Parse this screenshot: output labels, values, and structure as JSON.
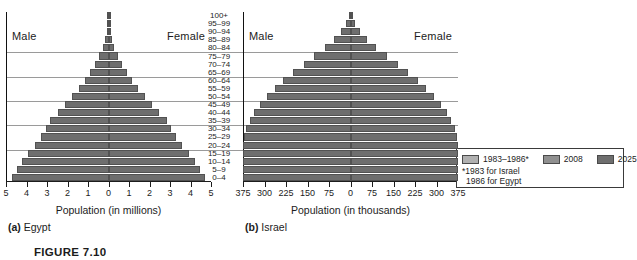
{
  "figure": {
    "caption": "FIGURE 7.10"
  },
  "age_groups": [
    "100+",
    "95–99",
    "90–94",
    "85–89",
    "80–84",
    "75–79",
    "70–74",
    "65–69",
    "60–64",
    "55–59",
    "50–54",
    "45–49",
    "40–44",
    "35–39",
    "30–34",
    "25–29",
    "20–24",
    "15–19",
    "10–14",
    "5–9",
    "0–4"
  ],
  "gridline_after_indices": [
    5,
    8,
    11,
    14,
    17
  ],
  "legend": {
    "entries": [
      {
        "label": "1983–1986*",
        "color": "#b0b0b0"
      },
      {
        "label": "2008",
        "color": "#909090"
      },
      {
        "label": "2025",
        "color": "#6e6e6e"
      }
    ],
    "note_line1": "*1983 for Israel",
    "note_line2": "1986 for Egypt"
  },
  "panels": {
    "egypt": {
      "caption_prefix": "(a)",
      "caption_name": "Egypt",
      "male_label": "Male",
      "female_label": "Female",
      "axis_title": "Population (in millions)",
      "tick_labels": [
        "5",
        "4",
        "3",
        "2",
        "1",
        "0",
        "1",
        "2",
        "3",
        "4",
        "5"
      ],
      "axis_max": 5
    },
    "israel": {
      "caption_prefix": "(b)",
      "caption_name": "Israel",
      "male_label": "Male",
      "female_label": "Female",
      "axis_title": "Population (in thousands)",
      "tick_labels": [
        "375",
        "300",
        "225",
        "150",
        "75",
        "0",
        "75",
        "150",
        "225",
        "300",
        "375"
      ],
      "axis_max": 375
    }
  },
  "chart_data": {
    "type": "bar",
    "subtype": "population-pyramid",
    "title": "FIGURE 7.10",
    "xlabel": "Population",
    "ylabel": "Age group",
    "grid": true,
    "legend_position": "right",
    "series_names": [
      "1983–1986*",
      "2008",
      "2025"
    ],
    "categories": [
      "100+",
      "95–99",
      "90–94",
      "85–89",
      "80–84",
      "75–79",
      "70–74",
      "65–69",
      "60–64",
      "55–59",
      "50–54",
      "45–49",
      "40–44",
      "35–39",
      "30–34",
      "25–29",
      "20–24",
      "15–19",
      "10–14",
      "5–9",
      "0–4"
    ],
    "charts": [
      {
        "name": "Egypt",
        "units": "millions",
        "xlim": [
          -5,
          5
        ],
        "xticks": [
          -5,
          -4,
          -3,
          -2,
          -1,
          0,
          1,
          2,
          3,
          4,
          5
        ],
        "xticklabels": [
          "5",
          "4",
          "3",
          "2",
          "1",
          "0",
          "1",
          "2",
          "3",
          "4",
          "5"
        ],
        "series": [
          {
            "name": "1983–1986*",
            "male": [
              0.0,
              0.01,
              0.02,
              0.05,
              0.1,
              0.17,
              0.26,
              0.38,
              0.52,
              0.68,
              0.86,
              1.06,
              1.28,
              1.52,
              1.78,
              2.06,
              2.36,
              2.68,
              3.02,
              3.38,
              3.76
            ],
            "female": [
              0.0,
              0.01,
              0.02,
              0.05,
              0.1,
              0.17,
              0.26,
              0.38,
              0.52,
              0.68,
              0.86,
              1.06,
              1.28,
              1.52,
              1.78,
              2.06,
              2.36,
              2.68,
              3.02,
              3.38,
              3.76
            ]
          },
          {
            "name": "2008",
            "male": [
              0.01,
              0.02,
              0.05,
              0.1,
              0.18,
              0.3,
              0.45,
              0.63,
              0.84,
              1.06,
              1.3,
              1.56,
              1.84,
              2.14,
              2.46,
              2.8,
              3.16,
              3.54,
              3.86,
              4.06,
              4.22
            ],
            "female": [
              0.01,
              0.02,
              0.05,
              0.1,
              0.18,
              0.3,
              0.45,
              0.63,
              0.84,
              1.06,
              1.3,
              1.56,
              1.84,
              2.14,
              2.46,
              2.8,
              3.16,
              3.54,
              3.86,
              4.06,
              4.22
            ]
          },
          {
            "name": "2025",
            "male": [
              0.02,
              0.04,
              0.09,
              0.17,
              0.29,
              0.45,
              0.65,
              0.89,
              1.16,
              1.46,
              1.78,
              2.12,
              2.48,
              2.86,
              3.04,
              3.3,
              3.6,
              3.92,
              4.22,
              4.46,
              4.7
            ],
            "female": [
              0.02,
              0.04,
              0.09,
              0.17,
              0.29,
              0.45,
              0.65,
              0.89,
              1.16,
              1.46,
              1.78,
              2.12,
              2.48,
              2.86,
              3.04,
              3.3,
              3.6,
              3.92,
              4.22,
              4.46,
              4.7
            ]
          }
        ]
      },
      {
        "name": "Israel",
        "units": "thousands",
        "xlim": [
          -375,
          375
        ],
        "xticks": [
          -375,
          -300,
          -225,
          -150,
          -75,
          0,
          75,
          150,
          225,
          300,
          375
        ],
        "xticklabels": [
          "375",
          "300",
          "225",
          "150",
          "75",
          "0",
          "75",
          "150",
          "225",
          "300",
          "375"
        ],
        "series": [
          {
            "name": "1983–1986*",
            "male": [
              1,
              4,
              10,
              20,
              35,
              55,
              78,
              102,
              128,
              154,
              180,
              206,
              230,
              252,
              272,
              290,
              304,
              314,
              320,
              322,
              320
            ],
            "female": [
              1,
              4,
              10,
              20,
              35,
              55,
              78,
              102,
              128,
              154,
              180,
              206,
              230,
              252,
              272,
              290,
              304,
              314,
              320,
              322,
              320
            ]
          },
          {
            "name": "2008",
            "male": [
              3,
              9,
              20,
              38,
              62,
              90,
              122,
              152,
              182,
              210,
              236,
              260,
              282,
              300,
              316,
              328,
              338,
              344,
              348,
              350,
              350
            ],
            "female": [
              3,
              9,
              20,
              38,
              62,
              90,
              122,
              152,
              182,
              210,
              236,
              260,
              282,
              300,
              316,
              328,
              338,
              344,
              348,
              350,
              350
            ]
          },
          {
            "name": "2025",
            "male": [
              6,
              16,
              34,
              58,
              90,
              126,
              164,
              200,
              234,
              264,
              292,
              316,
              336,
              352,
              364,
              372,
              376,
              378,
              378,
              376,
              374
            ],
            "female": [
              6,
              16,
              34,
              58,
              90,
              126,
              164,
              200,
              234,
              264,
              292,
              316,
              336,
              352,
              364,
              372,
              376,
              378,
              378,
              376,
              374
            ]
          }
        ]
      }
    ]
  }
}
